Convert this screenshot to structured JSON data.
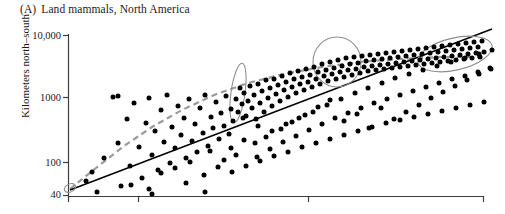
{
  "figure": {
    "panel_letter": "(A)",
    "title": "Land mammals, North America",
    "y_axis_label": "Kilometers north–south"
  },
  "chart_data": {
    "type": "scatter",
    "xlabel": "",
    "ylabel": "Kilometers north–south",
    "yscale": "log",
    "ylim": [
      40,
      10000
    ],
    "ytick_labels": [
      "10,000",
      "1000",
      "100",
      "40"
    ],
    "ytick_values": [
      10000,
      1000,
      100,
      40
    ],
    "xtick_count": 4,
    "xtick_labels": [
      "",
      "",
      "",
      ""
    ],
    "grid": false,
    "legend": null,
    "annotations": [
      {
        "name": "origin-ellipse",
        "cx": 70,
        "cy": 188,
        "rx": 6,
        "ry": 4,
        "rotation": -25
      },
      {
        "name": "cluster-ellipse-left",
        "cx": 238,
        "cy": 93,
        "rx": 7,
        "ry": 30,
        "rotation": 8
      },
      {
        "name": "cluster-ellipse-middle",
        "cx": 337,
        "cy": 62,
        "rx": 24,
        "ry": 25,
        "rotation": 0
      },
      {
        "name": "cluster-ellipse-right",
        "cx": 455,
        "cy": 54,
        "rx": 38,
        "ry": 16,
        "rotation": -13
      }
    ],
    "series": [
      {
        "name": "regression-line-solid",
        "type": "line",
        "style": "solid",
        "color": "#000000",
        "x": [
          70,
          492
        ],
        "y": [
          190,
          29
        ]
      },
      {
        "name": "fitted-curve-dashed",
        "type": "line",
        "style": "dashed",
        "color": "#9a9a9a",
        "points": [
          [
            70,
            189
          ],
          [
            96,
            168
          ],
          [
            124,
            146
          ],
          [
            152,
            127
          ],
          [
            182,
            110
          ],
          [
            214,
            95
          ],
          [
            248,
            83
          ],
          [
            284,
            74
          ],
          [
            322,
            67
          ],
          [
            360,
            62
          ],
          [
            400,
            59
          ],
          [
            440,
            57
          ],
          [
            478,
            57
          ]
        ]
      },
      {
        "name": "species-points",
        "type": "scatter",
        "color": "#000000",
        "marker_size": 5,
        "count": 252,
        "points": [
          [
            86,
            181
          ],
          [
            92,
            172
          ],
          [
            97,
            192
          ],
          [
            104,
            158
          ],
          [
            113,
            97
          ],
          [
            118,
            143
          ],
          [
            121,
            186
          ],
          [
            127,
            119
          ],
          [
            130,
            166
          ],
          [
            134,
            103
          ],
          [
            139,
            147
          ],
          [
            142,
            178
          ],
          [
            146,
            123
          ],
          [
            149,
            98
          ],
          [
            152,
            155
          ],
          [
            155,
            131
          ],
          [
            158,
            170
          ],
          [
            161,
            110
          ],
          [
            164,
            142
          ],
          [
            167,
            95
          ],
          [
            170,
            163
          ],
          [
            172,
            127
          ],
          [
            175,
            148
          ],
          [
            178,
            106
          ],
          [
            181,
            135
          ],
          [
            184,
            118
          ],
          [
            186,
            158
          ],
          [
            189,
            99
          ],
          [
            192,
            141
          ],
          [
            195,
            124
          ],
          [
            197,
            152
          ],
          [
            200,
            108
          ],
          [
            203,
            133
          ],
          [
            205,
            95
          ],
          [
            208,
            146
          ],
          [
            211,
            117
          ],
          [
            213,
            128
          ],
          [
            216,
            102
          ],
          [
            219,
            139
          ],
          [
            221,
            113
          ],
          [
            224,
            126
          ],
          [
            226,
            96
          ],
          [
            229,
            134
          ],
          [
            231,
            109
          ],
          [
            233,
            121
          ],
          [
            236,
            99
          ],
          [
            238,
            112
          ],
          [
            240,
            88
          ],
          [
            242,
            104
          ],
          [
            244,
            93
          ],
          [
            246,
            116
          ],
          [
            248,
            101
          ],
          [
            250,
            86
          ],
          [
            252,
            108
          ],
          [
            254,
            95
          ],
          [
            256,
            119
          ],
          [
            258,
            84
          ],
          [
            260,
            103
          ],
          [
            262,
            91
          ],
          [
            264,
            112
          ],
          [
            266,
            80
          ],
          [
            268,
            98
          ],
          [
            270,
            88
          ],
          [
            272,
            106
          ],
          [
            274,
            79
          ],
          [
            276,
            94
          ],
          [
            278,
            85
          ],
          [
            280,
            101
          ],
          [
            282,
            76
          ],
          [
            284,
            90
          ],
          [
            286,
            82
          ],
          [
            288,
            97
          ],
          [
            290,
            73
          ],
          [
            292,
            87
          ],
          [
            294,
            79
          ],
          [
            296,
            93
          ],
          [
            298,
            71
          ],
          [
            300,
            84
          ],
          [
            302,
            77
          ],
          [
            304,
            90
          ],
          [
            306,
            69
          ],
          [
            308,
            82
          ],
          [
            310,
            75
          ],
          [
            312,
            87
          ],
          [
            314,
            67
          ],
          [
            316,
            79
          ],
          [
            318,
            72
          ],
          [
            320,
            84
          ],
          [
            322,
            64
          ],
          [
            324,
            76
          ],
          [
            326,
            70
          ],
          [
            328,
            81
          ],
          [
            330,
            62
          ],
          [
            332,
            74
          ],
          [
            334,
            68
          ],
          [
            336,
            79
          ],
          [
            338,
            60
          ],
          [
            340,
            72
          ],
          [
            342,
            66
          ],
          [
            344,
            77
          ],
          [
            346,
            58
          ],
          [
            348,
            70
          ],
          [
            350,
            64
          ],
          [
            352,
            75
          ],
          [
            354,
            57
          ],
          [
            356,
            69
          ],
          [
            358,
            63
          ],
          [
            360,
            73
          ],
          [
            362,
            56
          ],
          [
            364,
            67
          ],
          [
            366,
            61
          ],
          [
            368,
            71
          ],
          [
            370,
            55
          ],
          [
            372,
            66
          ],
          [
            374,
            60
          ],
          [
            376,
            70
          ],
          [
            378,
            54
          ],
          [
            380,
            65
          ],
          [
            382,
            59
          ],
          [
            384,
            69
          ],
          [
            386,
            53
          ],
          [
            388,
            64
          ],
          [
            390,
            58
          ],
          [
            392,
            68
          ],
          [
            394,
            52
          ],
          [
            396,
            63
          ],
          [
            398,
            57
          ],
          [
            400,
            67
          ],
          [
            402,
            51
          ],
          [
            404,
            62
          ],
          [
            406,
            56
          ],
          [
            408,
            66
          ],
          [
            410,
            50
          ],
          [
            412,
            61
          ],
          [
            414,
            55
          ],
          [
            416,
            65
          ],
          [
            418,
            49
          ],
          [
            420,
            60
          ],
          [
            422,
            54
          ],
          [
            424,
            64
          ],
          [
            426,
            48
          ],
          [
            428,
            59
          ],
          [
            430,
            53
          ],
          [
            432,
            63
          ],
          [
            434,
            47
          ],
          [
            436,
            58
          ],
          [
            438,
            52
          ],
          [
            440,
            62
          ],
          [
            442,
            46
          ],
          [
            444,
            57
          ],
          [
            446,
            51
          ],
          [
            448,
            61
          ],
          [
            450,
            45
          ],
          [
            452,
            56
          ],
          [
            454,
            50
          ],
          [
            456,
            60
          ],
          [
            458,
            44
          ],
          [
            460,
            55
          ],
          [
            462,
            49
          ],
          [
            464,
            59
          ],
          [
            466,
            43
          ],
          [
            468,
            54
          ],
          [
            470,
            48
          ],
          [
            472,
            58
          ],
          [
            474,
            42
          ],
          [
            476,
            53
          ],
          [
            478,
            47
          ],
          [
            480,
            57
          ],
          [
            482,
            41
          ],
          [
            484,
            52
          ],
          [
            118,
            96
          ],
          [
            131,
            185
          ],
          [
            149,
            189
          ],
          [
            186,
            183
          ],
          [
            210,
            151
          ],
          [
            224,
            160
          ],
          [
            236,
            155
          ],
          [
            255,
            143
          ],
          [
            266,
            137
          ],
          [
            281,
            129
          ],
          [
            292,
            122
          ],
          [
            305,
            115
          ],
          [
            318,
            107
          ],
          [
            330,
            100
          ],
          [
            344,
            121
          ],
          [
            357,
            114
          ],
          [
            369,
            128
          ],
          [
            381,
            108
          ],
          [
            394,
            119
          ],
          [
            406,
            112
          ],
          [
            419,
            105
          ],
          [
            431,
            98
          ],
          [
            443,
            92
          ],
          [
            455,
            86
          ],
          [
            467,
            80
          ],
          [
            479,
            74
          ],
          [
            490,
            68
          ],
          [
            152,
            194
          ],
          [
            205,
            192
          ],
          [
            243,
            118
          ],
          [
            258,
            126
          ],
          [
            272,
            131
          ],
          [
            286,
            124
          ],
          [
            299,
            118
          ],
          [
            313,
            112
          ],
          [
            327,
            105
          ],
          [
            341,
            99
          ],
          [
            355,
            93
          ],
          [
            368,
            88
          ],
          [
            382,
            83
          ],
          [
            395,
            78
          ],
          [
            409,
            74
          ],
          [
            423,
            70
          ],
          [
            437,
            66
          ],
          [
            451,
            62
          ],
          [
            465,
            58
          ],
          [
            479,
            54
          ],
          [
            492,
            50
          ],
          [
            231,
            148
          ],
          [
            244,
            140
          ],
          [
            257,
            157
          ],
          [
            270,
            149
          ],
          [
            283,
            142
          ],
          [
            296,
            136
          ],
          [
            309,
            130
          ],
          [
            322,
            124
          ],
          [
            335,
            118
          ],
          [
            348,
            113
          ],
          [
            361,
            108
          ],
          [
            374,
            103
          ],
          [
            387,
            99
          ],
          [
            400,
            95
          ],
          [
            413,
            91
          ],
          [
            426,
            87
          ],
          [
            439,
            83
          ],
          [
            452,
            79
          ],
          [
            465,
            76
          ],
          [
            478,
            72
          ],
          [
            491,
            69
          ],
          [
            161,
            173
          ],
          [
            175,
            168
          ],
          [
            190,
            162
          ],
          [
            204,
            175
          ],
          [
            218,
            167
          ],
          [
            232,
            172
          ],
          [
            246,
            166
          ],
          [
            260,
            161
          ],
          [
            274,
            156
          ],
          [
            288,
            152
          ],
          [
            302,
            147
          ],
          [
            316,
            143
          ],
          [
            330,
            139
          ],
          [
            344,
            135
          ],
          [
            358,
            131
          ],
          [
            372,
            127
          ],
          [
            386,
            123
          ],
          [
            400,
            120
          ],
          [
            414,
            117
          ],
          [
            428,
            114
          ],
          [
            442,
            111
          ],
          [
            456,
            108
          ],
          [
            470,
            105
          ],
          [
            484,
            102
          ]
        ]
      }
    ]
  }
}
